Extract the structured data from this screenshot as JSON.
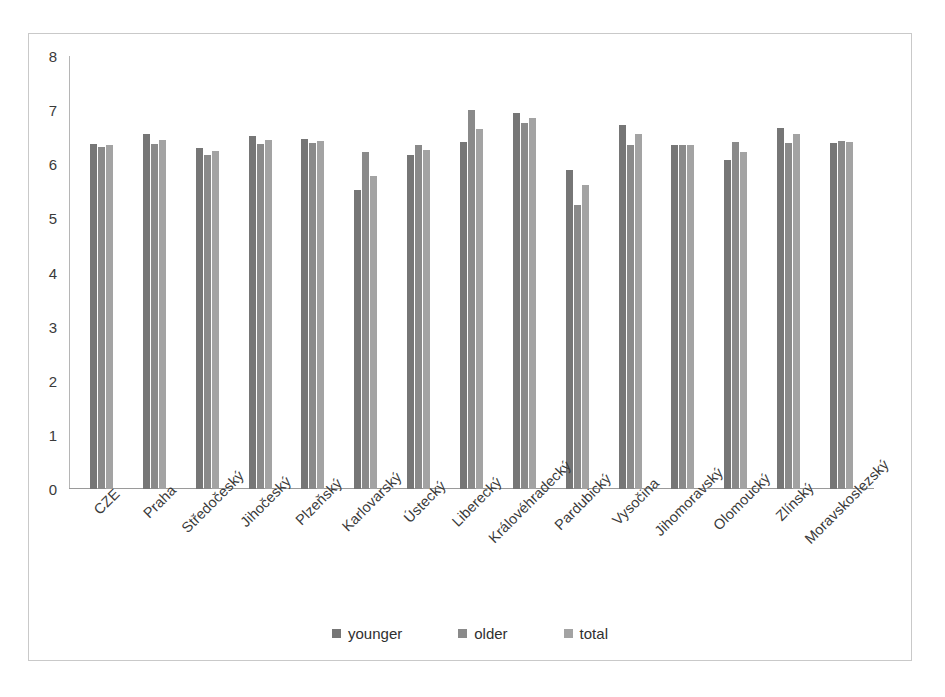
{
  "chart_data": {
    "type": "bar",
    "title": "",
    "xlabel": "",
    "ylabel": "",
    "ylim": [
      0,
      8
    ],
    "yticks": [
      0,
      1,
      2,
      3,
      4,
      5,
      6,
      7,
      8
    ],
    "grid": false,
    "legend_position": "bottom",
    "categories": [
      "CZE",
      "Praha",
      "Středočeský",
      "Jihočeský",
      "Plzeňský",
      "Karlovarský",
      "Ústecký",
      "Liberecký",
      "Královéhradecký",
      "Pardubický",
      "Vysočina",
      "Jihomoravský",
      "Olomoucký",
      "Zlínský",
      "Moravskoslezský"
    ],
    "series": [
      {
        "name": "younger",
        "color": "#767676",
        "values": [
          6.37,
          6.55,
          6.3,
          6.52,
          6.47,
          5.52,
          6.18,
          6.42,
          6.95,
          5.9,
          6.72,
          6.35,
          6.08,
          6.67,
          6.4
        ]
      },
      {
        "name": "older",
        "color": "#8a8a8a",
        "values": [
          6.32,
          6.38,
          6.18,
          6.38,
          6.4,
          6.22,
          6.35,
          7.0,
          6.77,
          5.25,
          6.35,
          6.35,
          6.42,
          6.4,
          6.43
        ]
      },
      {
        "name": "total",
        "color": "#a3a3a3",
        "values": [
          6.35,
          6.45,
          6.24,
          6.44,
          6.43,
          5.78,
          6.27,
          6.65,
          6.85,
          5.62,
          6.55,
          6.35,
          6.22,
          6.55,
          6.42
        ]
      }
    ]
  },
  "legend": {
    "items": [
      {
        "label": "younger",
        "color": "#767676"
      },
      {
        "label": "older",
        "color": "#8a8a8a"
      },
      {
        "label": "total",
        "color": "#a3a3a3"
      }
    ]
  }
}
